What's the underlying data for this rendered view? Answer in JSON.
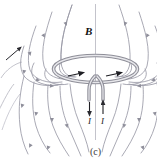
{
  "figure": {
    "caption": "(c)",
    "background_color": "#ffffff",
    "width": 157,
    "height": 163,
    "labels": {
      "field_label": "B",
      "current_label_left": "I",
      "current_label_right": "I"
    },
    "colors": {
      "field_line": "#9a9aa6",
      "axis_line": "#b9b9c2",
      "coil_outline": "#8e8e98",
      "coil_fill": "#d8d8de",
      "arrow_dark": "#1f1f24",
      "text": "#1a1a1a"
    },
    "elements": {
      "vertical_axis": "vertical symmetry axis through loop center",
      "loop": "elliptical current loop seen in perspective",
      "leads": "two parallel lead wires descending from loop",
      "field_lines_left": 7,
      "field_lines_right": 7,
      "inner_arrows": 2,
      "current_arrow_left_direction": "down",
      "current_arrow_right_direction": "up"
    }
  },
  "adjacent_figure": {
    "present": true,
    "description": "partial edge of neighboring panel (b) at left with diagonal arrow"
  }
}
